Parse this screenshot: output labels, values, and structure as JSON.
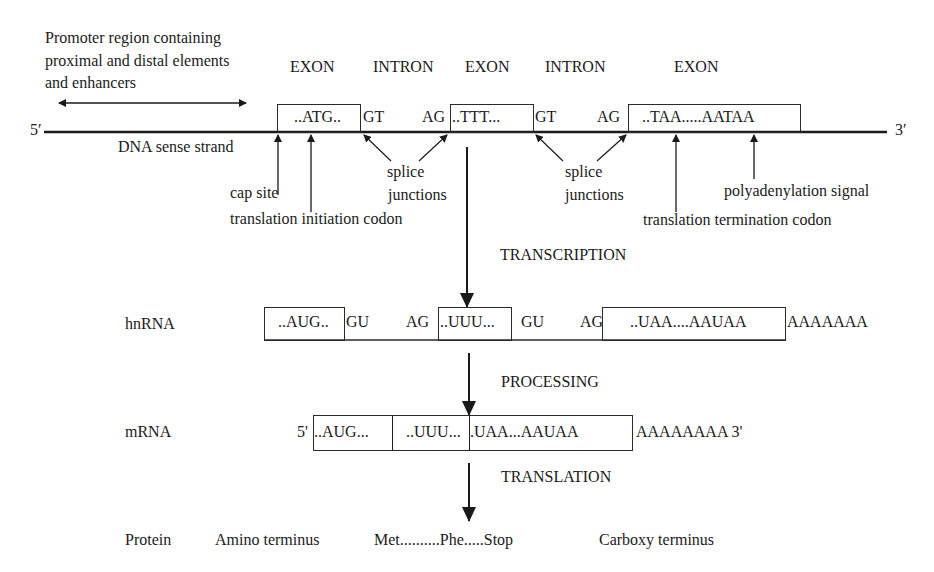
{
  "promoter": {
    "lines": [
      "Promoter region containing",
      "proximal and distal elements",
      "and enhancers"
    ]
  },
  "dna": {
    "five_prime": "5′",
    "three_prime": "3′",
    "strand_label": "DNA sense strand",
    "region_labels": [
      "EXON",
      "INTRON",
      "EXON",
      "INTRON",
      "EXON"
    ],
    "exons": [
      "..ATG..",
      "..TTT...",
      "..TAA.....AATAA"
    ],
    "splice_sites": [
      "GT",
      "AG",
      "GT",
      "AG"
    ],
    "annotations": {
      "cap_site": "cap site",
      "translation_initiation": "translation initiation codon",
      "splice_junctions_1": [
        "splice",
        "junctions"
      ],
      "splice_junctions_2": [
        "splice",
        "junctions"
      ],
      "translation_termination": "translation termination codon",
      "polyadenylation": "polyadenylation signal"
    }
  },
  "steps": {
    "transcription": "TRANSCRIPTION",
    "processing": "PROCESSING",
    "translation": "TRANSLATION"
  },
  "hnrna": {
    "label": "hnRNA",
    "exons": [
      "..AUG..",
      "..UUU...",
      "..UAA....AAUAA"
    ],
    "splice_sites": [
      "GU",
      "AG",
      "GU",
      "AG"
    ],
    "poly_a": "AAAAAAA"
  },
  "mrna": {
    "label": "mRNA",
    "five_prime": "5'",
    "segments": [
      "..AUG...",
      "..UUU...",
      ".UAA...AAUAA"
    ],
    "poly_a": "AAAAAAAA 3'"
  },
  "protein": {
    "label": "Protein",
    "amino_terminus": "Amino terminus",
    "sequence": "Met..........Phe.....Stop",
    "carboxy_terminus": "Carboxy terminus"
  }
}
